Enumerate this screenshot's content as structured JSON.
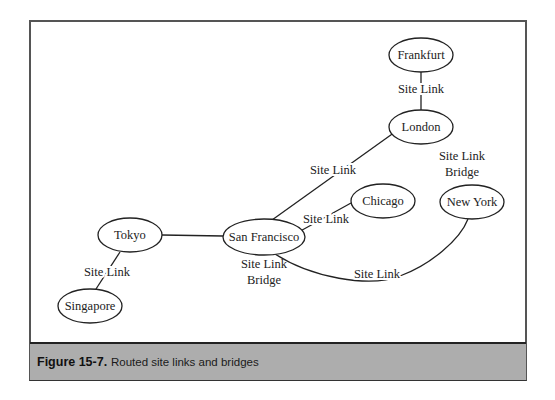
{
  "figure": {
    "number": "Figure 15-7.",
    "caption": "Routed site links and bridges"
  },
  "nodes": [
    {
      "id": "frankfurt",
      "label": "Frankfurt",
      "cx": 421,
      "cy": 55,
      "rx": 32,
      "ry": 17
    },
    {
      "id": "london",
      "label": "London",
      "cx": 421,
      "cy": 127,
      "rx": 32,
      "ry": 17
    },
    {
      "id": "chicago",
      "label": "Chicago",
      "cx": 383,
      "cy": 201,
      "rx": 32,
      "ry": 17
    },
    {
      "id": "new-york",
      "label": "New York",
      "cx": 472,
      "cy": 202,
      "rx": 32,
      "ry": 17
    },
    {
      "id": "tokyo",
      "label": "Tokyo",
      "cx": 130,
      "cy": 235,
      "rx": 32,
      "ry": 17
    },
    {
      "id": "san-francisco",
      "label": "San Francisco",
      "cx": 264,
      "cy": 237,
      "rx": 41,
      "ry": 18
    },
    {
      "id": "singapore",
      "label": "Singapore",
      "cx": 90,
      "cy": 306,
      "rx": 32,
      "ry": 17
    }
  ],
  "edges": [
    {
      "from": "frankfurt",
      "to": "london",
      "label": "Site Link"
    },
    {
      "from": "san-francisco",
      "to": "london",
      "label": "Site Link"
    },
    {
      "from": "san-francisco",
      "to": "chicago",
      "label": "Site Link"
    },
    {
      "from": "tokyo",
      "to": "san-francisco",
      "label": ""
    },
    {
      "from": "tokyo",
      "to": "singapore",
      "label": "Site Link"
    },
    {
      "from": "san-francisco",
      "to": "new-york",
      "label": "Site Link"
    }
  ],
  "labels": {
    "frankfurt_london": "Site Link",
    "sf_london": "Site Link",
    "sf_chicago": "Site Link",
    "tokyo_singapore": "Site Link",
    "sf_newyork": "Site Link",
    "london_bridge_line1": "Site Link",
    "london_bridge_line2": "Bridge",
    "sf_bridge_line1": "Site Link",
    "sf_bridge_line2": "Bridge"
  },
  "node_labels": {
    "frankfurt": "Frankfurt",
    "london": "London",
    "chicago": "Chicago",
    "new_york": "New York",
    "tokyo": "Tokyo",
    "san_francisco": "San Francisco",
    "singapore": "Singapore"
  }
}
